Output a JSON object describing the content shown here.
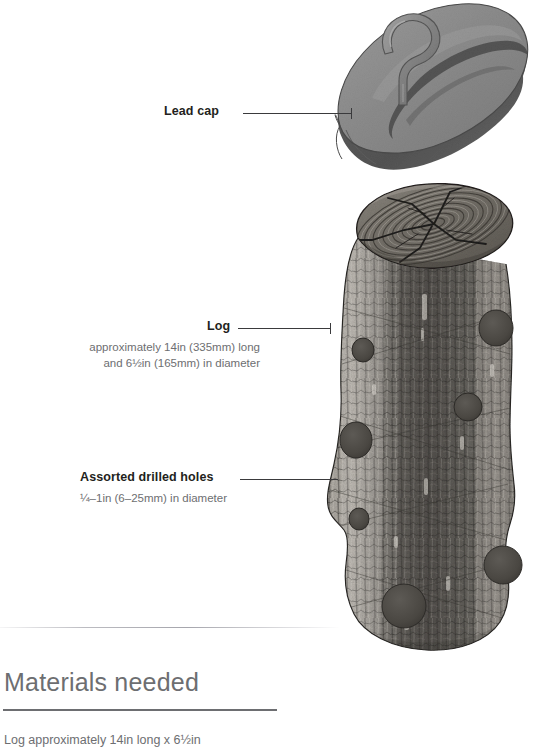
{
  "figure": {
    "labels": [
      {
        "id": "lead-cap",
        "name": "Lead cap",
        "sub": "",
        "x": 164,
        "y": 104,
        "leader_x1": 243,
        "leader_x2": 352,
        "leader_y": 113
      },
      {
        "id": "log",
        "name": "Log",
        "sub_line1": "approximately 14in (335mm) long",
        "sub_line2": "and 6½in (165mm) in diameter",
        "x": 207,
        "y": 319,
        "leader_x1": 238,
        "leader_x2": 331,
        "leader_y": 328
      },
      {
        "id": "assorted-drilled-holes",
        "name": "Assorted drilled holes",
        "sub_line1": "¼–1in (6–25mm) in diameter",
        "x": 80,
        "y": 470,
        "leader_x1": 240,
        "leader_x2": 338,
        "leader_y": 479
      }
    ]
  },
  "materials": {
    "heading": "Materials needed",
    "line1": "Log approximately 14in long x 6½in"
  },
  "colors": {
    "ink": "#231f20",
    "muted": "#6d6e71",
    "leader": "#3a3a3c",
    "lead_cap_top": "#8a8a8a",
    "lead_cap_edge": "#595959",
    "lead_cap_shadow": "#6f6f6f",
    "bark_light": "#b5b2ac",
    "bark_mid": "#7e7b76",
    "bark_dark": "#4a4844",
    "hole_fill": "#4e4b47",
    "endgrain_light": "#9c9790",
    "endgrain_dark": "#5e5a54"
  },
  "icons": {
    "lead_cap": "lead-cap-icon",
    "log": "log-icon",
    "hook": "screw-eye-hook-icon"
  }
}
